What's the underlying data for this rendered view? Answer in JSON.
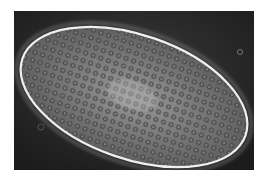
{
  "image": {
    "subject": "paramecium cell under phase-contrast microscopy",
    "background_color": "#262626",
    "cell_outline_color": "#f0f0f0",
    "cell_fill_color": "#7a7a7a"
  }
}
